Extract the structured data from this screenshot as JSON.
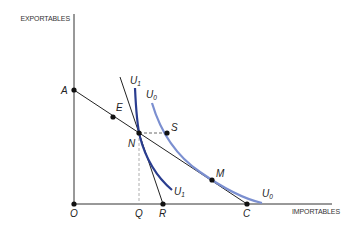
{
  "diagram": {
    "axes": {
      "y_label": "EXPORTABLES",
      "x_label": "IMPORTABLES"
    },
    "points": {
      "O": "O",
      "A": "A",
      "E": "E",
      "N": "N",
      "S": "S",
      "M": "M",
      "C": "C",
      "Q": "Q",
      "R": "R"
    },
    "curves": {
      "U1_main": "U",
      "U1_sub": "1",
      "U0_main": "U",
      "U0_sub": "0"
    },
    "colors": {
      "axis": "#333333",
      "line": "#222222",
      "u1": "#2a3d8f",
      "u0": "#7b8fd0",
      "dashed": "#999999"
    }
  }
}
